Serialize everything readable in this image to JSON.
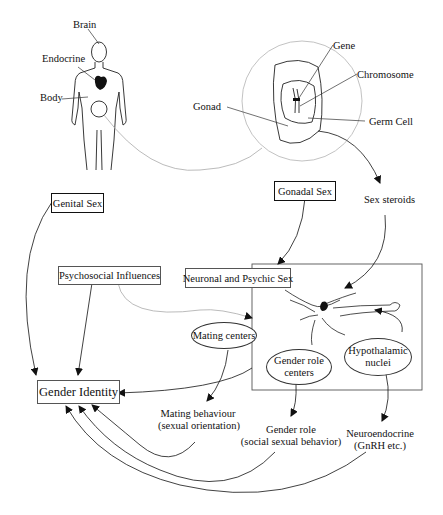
{
  "body_figure": {
    "labels": {
      "brain": "Brain",
      "endocrine": "Endocrine",
      "body": "Body"
    }
  },
  "gonad_detail": {
    "labels": {
      "gonad": "Gonad",
      "gene": "Gene",
      "chromosome": "Chromosome",
      "germ_cell": "Germ Cell"
    }
  },
  "boxes": {
    "genital_sex": "Genital Sex",
    "gonadal_sex": "Gonadal Sex",
    "psychosocial": "Psychosocial Influences",
    "neuronal_psychic": "Neuronal and Psychic Sex",
    "gender_identity": "Gender Identity"
  },
  "nodes": {
    "sex_steroids": "Sex steroids",
    "mating_centers": "Mating centers",
    "gender_role_centers_1": "Gender role",
    "gender_role_centers_2": "centers",
    "hypothalamic_1": "Hypothalamic",
    "hypothalamic_2": "nuclei"
  },
  "outputs": {
    "mating_behaviour_1": "Mating behaviour",
    "mating_behaviour_2": "(sexual orientation)",
    "gender_role_1": "Gender role",
    "gender_role_2": "(social sexual behavior)",
    "neuroendocrine_1": "Neuroendocrine",
    "neuroendocrine_2": "(GnRH etc.)"
  }
}
